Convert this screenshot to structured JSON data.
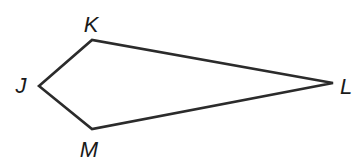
{
  "diagram": {
    "type": "kite",
    "stroke_color": "#2b2b2b",
    "background": "#ffffff",
    "vertices": [
      {
        "name": "K",
        "x": 92,
        "y": 40,
        "label_x": 91,
        "label_y": 32
      },
      {
        "name": "L",
        "x": 333,
        "y": 83,
        "label_x": 346,
        "label_y": 94
      },
      {
        "name": "M",
        "x": 92,
        "y": 129,
        "label_x": 89,
        "label_y": 157
      },
      {
        "name": "J",
        "x": 39,
        "y": 86,
        "label_x": 21,
        "label_y": 93
      }
    ],
    "edges": [
      {
        "from": "J",
        "to": "K"
      },
      {
        "from": "K",
        "to": "L"
      },
      {
        "from": "L",
        "to": "M"
      },
      {
        "from": "M",
        "to": "J"
      }
    ],
    "labels": {
      "K": "K",
      "L": "L",
      "M": "M",
      "J": "J"
    }
  }
}
